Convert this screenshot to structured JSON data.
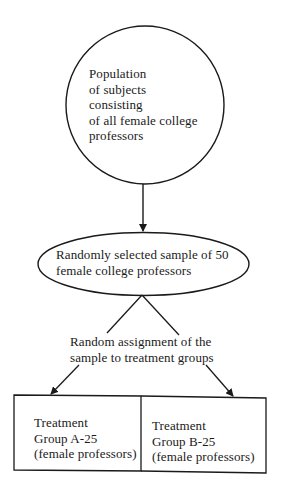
{
  "diagram": {
    "population_node": {
      "shape": "circle",
      "lines": [
        "Population",
        "of subjects",
        "consisting",
        "of all female college",
        "professors"
      ]
    },
    "sample_node": {
      "shape": "ellipse",
      "lines": [
        "Randomly selected sample of 50",
        "female college professors"
      ]
    },
    "assignment_label": {
      "lines": [
        "Random assignment of the",
        "sample to treatment groups"
      ]
    },
    "groups": [
      {
        "lines": [
          "Treatment",
          "Group A-25",
          "(female professors)"
        ]
      },
      {
        "lines": [
          "Treatment",
          "Group B-25",
          "(female professors)"
        ]
      }
    ],
    "edges": [
      {
        "from": "population_node",
        "to": "sample_node",
        "arrow": true
      },
      {
        "from": "sample_node",
        "to": "assignment_label",
        "arrow": false
      },
      {
        "from": "assignment_label",
        "to": "groups.0",
        "arrow": true
      },
      {
        "from": "assignment_label",
        "to": "groups.1",
        "arrow": true
      }
    ],
    "colors": {
      "stroke": "#1a1a1a",
      "background": "#ffffff"
    }
  }
}
